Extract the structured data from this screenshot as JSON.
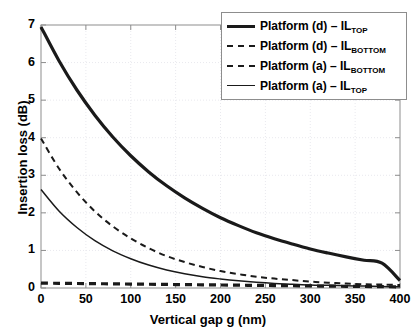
{
  "chart_data": {
    "type": "line",
    "title": "",
    "xlabel": "Vertical gap g (nm)",
    "ylabel": "Insertion loss (dB)",
    "xlim": [
      0,
      400
    ],
    "ylim": [
      0,
      7
    ],
    "xticks": [
      0,
      50,
      100,
      150,
      200,
      250,
      300,
      350,
      400
    ],
    "yticks": [
      0,
      1,
      2,
      3,
      4,
      5,
      6,
      7
    ],
    "xtick_labels": [
      "0",
      "50",
      "100",
      "150",
      "200",
      "250",
      "300",
      "350",
      "400"
    ],
    "ytick_labels": [
      "0",
      "1",
      "2",
      "3",
      "4",
      "5",
      "6",
      "7"
    ],
    "grid": true,
    "grid_style": "dotted",
    "legend_position": "top-right",
    "x": [
      0,
      20,
      40,
      60,
      80,
      100,
      120,
      140,
      160,
      180,
      200,
      220,
      240,
      260,
      280,
      300,
      320,
      340,
      360,
      380,
      400
    ],
    "series": [
      {
        "name": "Platform (d) – IL_TOP",
        "label_main": "Platform (d) – IL",
        "label_sub": "TOP",
        "style": "solid",
        "width": "thick",
        "color": "#1a1a1a",
        "values": [
          6.95,
          6.05,
          5.27,
          4.6,
          4.02,
          3.52,
          3.09,
          2.72,
          2.4,
          2.12,
          1.87,
          1.66,
          1.47,
          1.31,
          1.17,
          1.04,
          0.93,
          0.83,
          0.74,
          0.66,
          0.2
        ]
      },
      {
        "name": "Platform (d) – IL_BOTTOM",
        "label_main": "Platform (d) – IL",
        "label_sub": "BOTTOM",
        "style": "dashed",
        "width": "thick",
        "color": "#1a1a1a",
        "values": [
          0.13,
          0.125,
          0.12,
          0.115,
          0.11,
          0.105,
          0.1,
          0.095,
          0.09,
          0.085,
          0.08,
          0.075,
          0.07,
          0.065,
          0.06,
          0.055,
          0.05,
          0.045,
          0.04,
          0.035,
          0.03
        ]
      },
      {
        "name": "Platform (a) – IL_BOTTOM",
        "label_main": "Platform (a) – IL",
        "label_sub": "BOTTOM",
        "style": "dashed",
        "width": "medium",
        "color": "#1a1a1a",
        "values": [
          3.98,
          3.18,
          2.55,
          2.04,
          1.64,
          1.32,
          1.06,
          0.85,
          0.69,
          0.56,
          0.45,
          0.37,
          0.3,
          0.25,
          0.21,
          0.17,
          0.14,
          0.12,
          0.1,
          0.09,
          0.08
        ]
      },
      {
        "name": "Platform (a) – IL_TOP",
        "label_main": "Platform (a) – IL",
        "label_sub": "TOP",
        "style": "solid",
        "width": "thin",
        "color": "#1a1a1a",
        "values": [
          2.62,
          2.05,
          1.61,
          1.26,
          0.99,
          0.78,
          0.61,
          0.48,
          0.38,
          0.3,
          0.24,
          0.19,
          0.15,
          0.12,
          0.1,
          0.08,
          0.07,
          0.06,
          0.05,
          0.04,
          0.03
        ]
      }
    ]
  },
  "legend": {
    "entries": [
      {
        "main": "Platform (d) – IL",
        "sub": "TOP"
      },
      {
        "main": "Platform (d) – IL",
        "sub": "BOTTOM"
      },
      {
        "main": "Platform (a) – IL",
        "sub": "BOTTOM"
      },
      {
        "main": "Platform (a) – IL",
        "sub": "TOP"
      }
    ]
  },
  "colors": {
    "curve": "#1a1a1a",
    "axis": "#8d8d8d",
    "grid": "#e9e9ee",
    "background": "#ffffff"
  }
}
